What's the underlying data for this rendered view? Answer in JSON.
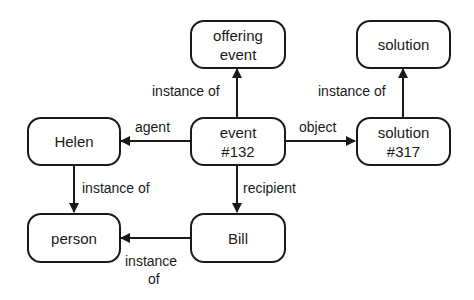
{
  "nodes": {
    "offering_event": {
      "line1": "offering",
      "line2": "event"
    },
    "solution": {
      "line1": "solution"
    },
    "helen": {
      "line1": "Helen"
    },
    "event132": {
      "line1": "event",
      "line2": "#132"
    },
    "solution317": {
      "line1": "solution",
      "line2": "#317"
    },
    "person": {
      "line1": "person"
    },
    "bill": {
      "line1": "Bill"
    }
  },
  "edges": {
    "event_instance_of": "instance of",
    "solution317_instance_of": "instance of",
    "agent": "agent",
    "object": "object",
    "helen_instance_of": "instance of",
    "recipient": "recipient",
    "bill_instance_of_line1": "instance",
    "bill_instance_of_line2": "of"
  },
  "colors": {
    "stroke": "#1a1a1a",
    "background": "#ffffff"
  }
}
